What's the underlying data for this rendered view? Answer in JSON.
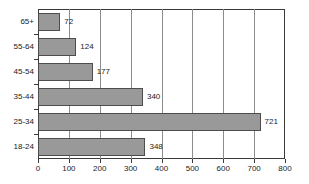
{
  "chart_data": {
    "type": "bar",
    "orientation": "horizontal",
    "title": "",
    "subtitle": "",
    "xlabel": "",
    "ylabel": "",
    "categories": [
      "18-24",
      "25-34",
      "35-44",
      "45-54",
      "55-64",
      "65+"
    ],
    "values": [
      348,
      721,
      340,
      177,
      124,
      72
    ],
    "data_labels": [
      "348",
      "721",
      "340",
      "177",
      "124",
      "72"
    ],
    "xlim": [
      0,
      800
    ],
    "xticks": [
      0,
      100,
      200,
      300,
      400,
      500,
      600,
      700,
      800
    ],
    "xtick_labels": [
      "0",
      "100",
      "200",
      "300",
      "400",
      "500",
      "600",
      "700",
      "800"
    ],
    "grid": "vertical",
    "legend": null,
    "colors": {
      "bar_fill": "#999999",
      "bar_border": "#4d4d4d",
      "gridline": "#8c8c8c",
      "frame": "#3a3a3a",
      "text": "#1a1a1a",
      "background": "#ffffff"
    }
  }
}
